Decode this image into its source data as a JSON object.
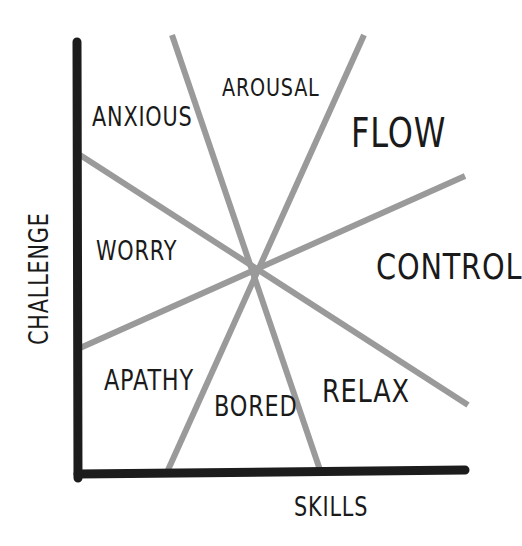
{
  "diagram": {
    "axes": {
      "x_label": "SKILLS",
      "y_label": "CHALLENGE"
    },
    "regions": [
      {
        "name": "ANXIOUS"
      },
      {
        "name": "AROUSAL"
      },
      {
        "name": "FLOW"
      },
      {
        "name": "WORRY"
      },
      {
        "name": "CONTROL"
      },
      {
        "name": "APATHY"
      },
      {
        "name": "BORED"
      },
      {
        "name": "RELAX"
      }
    ],
    "colors": {
      "axis": "#1c1c1c",
      "dividers": "#9a9a9a",
      "text": "#1a1a1a"
    }
  }
}
